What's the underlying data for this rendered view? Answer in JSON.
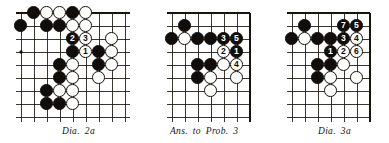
{
  "page": {
    "kind": "go-problem-diagrams",
    "background": "#ffffff",
    "ink": "#17140f",
    "stone_black": "#100d0a",
    "stone_white": "#fdfdfb"
  },
  "diagrams": [
    {
      "id": "dia-2a",
      "caption": {
        "parts": [
          "Dia.",
          "2a"
        ],
        "text": "Dia.  2a"
      },
      "board": {
        "cols": 9,
        "rows": 9,
        "cell": 13.0,
        "edges": {
          "top": true,
          "left": false,
          "right": false,
          "bottom": false
        },
        "star_points": [
          {
            "c": 0,
            "r": 3
          },
          {
            "c": 6,
            "r": 3
          }
        ]
      },
      "stones": [
        {
          "c": 1,
          "r": 0,
          "color": "black"
        },
        {
          "c": 2,
          "r": 0,
          "color": "white"
        },
        {
          "c": 3,
          "r": 0,
          "color": "white"
        },
        {
          "c": 4,
          "r": 0,
          "color": "black"
        },
        {
          "c": 5,
          "r": 0,
          "color": "white"
        },
        {
          "c": 0,
          "r": 1,
          "color": "black"
        },
        {
          "c": 2,
          "r": 1,
          "color": "black"
        },
        {
          "c": 3,
          "r": 1,
          "color": "black"
        },
        {
          "c": 4,
          "r": 1,
          "color": "white"
        },
        {
          "c": 5,
          "r": 1,
          "color": "white"
        },
        {
          "c": 4,
          "r": 2,
          "color": "black",
          "label": "2"
        },
        {
          "c": 5,
          "r": 2,
          "color": "white",
          "label": "3"
        },
        {
          "c": 7,
          "r": 2,
          "color": "white"
        },
        {
          "c": 4,
          "r": 3,
          "color": "black"
        },
        {
          "c": 5,
          "r": 3,
          "color": "white",
          "label": "1"
        },
        {
          "c": 6,
          "r": 3,
          "color": "black"
        },
        {
          "c": 7,
          "r": 3,
          "color": "white"
        },
        {
          "c": 3,
          "r": 4,
          "color": "black"
        },
        {
          "c": 4,
          "r": 4,
          "color": "white"
        },
        {
          "c": 6,
          "r": 4,
          "color": "black"
        },
        {
          "c": 7,
          "r": 4,
          "color": "white"
        },
        {
          "c": 3,
          "r": 5,
          "color": "black"
        },
        {
          "c": 4,
          "r": 5,
          "color": "white"
        },
        {
          "c": 6,
          "r": 5,
          "color": "white"
        },
        {
          "c": 2,
          "r": 6,
          "color": "black"
        },
        {
          "c": 3,
          "r": 6,
          "color": "white"
        },
        {
          "c": 4,
          "r": 6,
          "color": "white"
        },
        {
          "c": 2,
          "r": 7,
          "color": "black"
        },
        {
          "c": 3,
          "r": 7,
          "color": "black"
        },
        {
          "c": 4,
          "r": 7,
          "color": "white"
        }
      ]
    },
    {
      "id": "ans-to-prob-3",
      "caption": {
        "parts": [
          "Ans.",
          "to",
          "Prob.",
          "3"
        ],
        "text": "Ans. to Prob. 3"
      },
      "board": {
        "cols": 7,
        "rows": 9,
        "cell": 13.0,
        "edges": {
          "top": true,
          "left": false,
          "right": true,
          "bottom": false
        },
        "star_points": []
      },
      "stones": [
        {
          "c": 1,
          "r": 1,
          "color": "black"
        },
        {
          "c": 0,
          "r": 2,
          "color": "black"
        },
        {
          "c": 1,
          "r": 2,
          "color": "white"
        },
        {
          "c": 2,
          "r": 2,
          "color": "black"
        },
        {
          "c": 3,
          "r": 2,
          "color": "black"
        },
        {
          "c": 4,
          "r": 2,
          "color": "black",
          "label": "3"
        },
        {
          "c": 5,
          "r": 2,
          "color": "black",
          "label": "5"
        },
        {
          "c": 4,
          "r": 3,
          "color": "white",
          "label": "2"
        },
        {
          "c": 5,
          "r": 3,
          "color": "black",
          "label": "1"
        },
        {
          "c": 2,
          "r": 4,
          "color": "black"
        },
        {
          "c": 3,
          "r": 4,
          "color": "black"
        },
        {
          "c": 4,
          "r": 4,
          "color": "white"
        },
        {
          "c": 5,
          "r": 4,
          "color": "white",
          "label": "4"
        },
        {
          "c": 2,
          "r": 5,
          "color": "black"
        },
        {
          "c": 3,
          "r": 5,
          "color": "white"
        },
        {
          "c": 5,
          "r": 5,
          "color": "white"
        },
        {
          "c": 3,
          "r": 6,
          "color": "white"
        }
      ]
    },
    {
      "id": "dia-3a",
      "caption": {
        "parts": [
          "Dia.",
          "3a"
        ],
        "text": "Dia.  3a"
      },
      "board": {
        "cols": 7,
        "rows": 9,
        "cell": 13.0,
        "edges": {
          "top": true,
          "left": false,
          "right": true,
          "bottom": false
        },
        "star_points": []
      },
      "stones": [
        {
          "c": 1,
          "r": 1,
          "color": "black"
        },
        {
          "c": 4,
          "r": 1,
          "color": "black",
          "label": "7"
        },
        {
          "c": 5,
          "r": 1,
          "color": "black",
          "label": "5"
        },
        {
          "c": 0,
          "r": 2,
          "color": "black"
        },
        {
          "c": 1,
          "r": 2,
          "color": "white"
        },
        {
          "c": 2,
          "r": 2,
          "color": "black"
        },
        {
          "c": 3,
          "r": 2,
          "color": "black"
        },
        {
          "c": 4,
          "r": 2,
          "color": "black",
          "label": "3"
        },
        {
          "c": 5,
          "r": 2,
          "color": "white",
          "label": "4"
        },
        {
          "c": 3,
          "r": 3,
          "color": "black",
          "label": "1"
        },
        {
          "c": 4,
          "r": 3,
          "color": "white",
          "label": "2"
        },
        {
          "c": 5,
          "r": 3,
          "color": "white",
          "label": "6"
        },
        {
          "c": 2,
          "r": 4,
          "color": "black"
        },
        {
          "c": 3,
          "r": 4,
          "color": "black"
        },
        {
          "c": 4,
          "r": 4,
          "color": "white"
        },
        {
          "c": 2,
          "r": 5,
          "color": "black"
        },
        {
          "c": 3,
          "r": 5,
          "color": "white"
        },
        {
          "c": 5,
          "r": 5,
          "color": "white"
        },
        {
          "c": 3,
          "r": 6,
          "color": "white"
        }
      ]
    }
  ]
}
